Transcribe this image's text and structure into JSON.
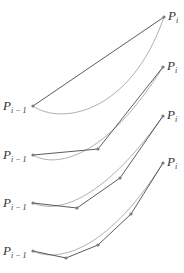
{
  "diagram": {
    "colors": {
      "polyline": "#4a4a4a",
      "curve": "#9a9a9a",
      "points": "#7a7a7a"
    },
    "label_start": {
      "main": "P",
      "sub": "i − 1"
    },
    "label_end": {
      "main": "P",
      "sub": "i"
    },
    "panels": [
      {
        "segments": 1,
        "polyline": [
          [
            33,
            106
          ],
          [
            164,
            17
          ]
        ],
        "curve": "M33,106 C60,125 130,115 164,17"
      },
      {
        "segments": 2,
        "polyline": [
          [
            33,
            155
          ],
          [
            98,
            149
          ],
          [
            163,
            67
          ]
        ],
        "curve": "M33,155 C55,168 105,160 163,67"
      },
      {
        "segments": 3,
        "polyline": [
          [
            33,
            203
          ],
          [
            77,
            208
          ],
          [
            120,
            178
          ],
          [
            163,
            116
          ]
        ],
        "curve": "M33,203 C55,213 100,205 163,116"
      },
      {
        "segments": 4,
        "polyline": [
          [
            33,
            251
          ],
          [
            66,
            258
          ],
          [
            98,
            245
          ],
          [
            131,
            214
          ],
          [
            163,
            163
          ]
        ],
        "curve": "M33,251 C55,262 105,255 163,163"
      }
    ]
  }
}
